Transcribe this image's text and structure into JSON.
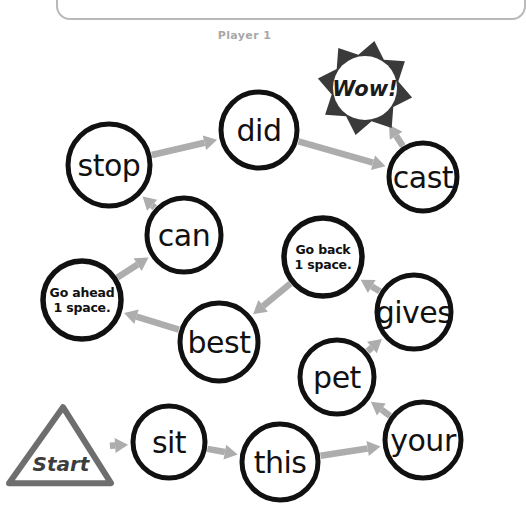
{
  "page": {
    "title": "Player 1",
    "background_color": "#ffffff",
    "frame_color": "#b9b9b9",
    "label_color": "#a8a8a8",
    "width": 489,
    "height": 523
  },
  "colors": {
    "node_stroke": "#111111",
    "node_fill": "#ffffff",
    "arrow": "#adadad",
    "burst": "#3a3a3a",
    "start_outline": "#6e6e6e",
    "text": "#111111"
  },
  "start": {
    "label": "Start",
    "cx": 61,
    "cy": 449,
    "half_width": 52,
    "height": 76
  },
  "reward": {
    "label": "Wow!",
    "cx": 365,
    "cy": 88,
    "radius": 33,
    "points": 8
  },
  "nodes": [
    {
      "id": "sit",
      "label": "sit",
      "type": "word",
      "cx": 169,
      "cy": 442,
      "r": 36
    },
    {
      "id": "this",
      "label": "this",
      "type": "word",
      "cx": 280,
      "cy": 462,
      "r": 38
    },
    {
      "id": "your",
      "label": "your",
      "type": "word",
      "cx": 423,
      "cy": 440,
      "r": 38
    },
    {
      "id": "pet",
      "label": "pet",
      "type": "word",
      "cx": 337,
      "cy": 377,
      "r": 37
    },
    {
      "id": "gives",
      "label": "gives",
      "type": "word",
      "cx": 414,
      "cy": 312,
      "r": 37
    },
    {
      "id": "goback",
      "label": "Go back\n1 space.",
      "type": "instruction",
      "cx": 323,
      "cy": 257,
      "r": 39
    },
    {
      "id": "best",
      "label": "best",
      "type": "word",
      "cx": 219,
      "cy": 342,
      "r": 39
    },
    {
      "id": "goahead",
      "label": "Go ahead\n1 space.",
      "type": "instruction",
      "cx": 82,
      "cy": 300,
      "r": 39
    },
    {
      "id": "can",
      "label": "can",
      "type": "word",
      "cx": 184,
      "cy": 235,
      "r": 37
    },
    {
      "id": "stop",
      "label": "stop",
      "type": "word",
      "cx": 109,
      "cy": 165,
      "r": 41
    },
    {
      "id": "did",
      "label": "did",
      "type": "word",
      "cx": 259,
      "cy": 130,
      "r": 38
    },
    {
      "id": "cast",
      "label": "cast",
      "type": "word",
      "cx": 423,
      "cy": 177,
      "r": 34
    }
  ],
  "arrows": [
    {
      "from": "start",
      "to": "sit"
    },
    {
      "from": "sit",
      "to": "this"
    },
    {
      "from": "this",
      "to": "your"
    },
    {
      "from": "your",
      "to": "pet"
    },
    {
      "from": "pet",
      "to": "gives"
    },
    {
      "from": "gives",
      "to": "goback"
    },
    {
      "from": "goback",
      "to": "best"
    },
    {
      "from": "best",
      "to": "goahead"
    },
    {
      "from": "goahead",
      "to": "can"
    },
    {
      "from": "can",
      "to": "stop"
    },
    {
      "from": "stop",
      "to": "did"
    },
    {
      "from": "did",
      "to": "cast"
    },
    {
      "from": "cast",
      "to": "reward"
    }
  ]
}
